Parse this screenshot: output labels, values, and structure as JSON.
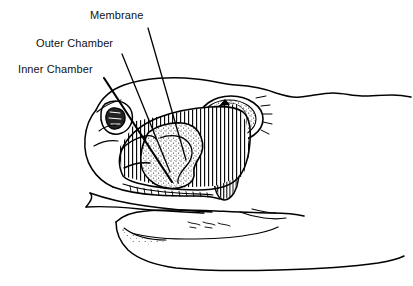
{
  "figure": {
    "style": "black and white pen line drawing",
    "background_color": "#ffffff",
    "ink_color": "#000000"
  },
  "labels": {
    "membrane": "Membrane",
    "outer_chamber": "Outer Chamber",
    "inner_chamber": "Inner Chamber"
  },
  "leader_lines": [
    {
      "name": "membrane-leader",
      "from": [
        148,
        28
      ],
      "to": [
        186,
        160
      ]
    },
    {
      "name": "outer-chamber-leader",
      "from": [
        122,
        54
      ],
      "to": [
        170,
        172
      ]
    },
    {
      "name": "inner-chamber-leader",
      "from": [
        104,
        78
      ],
      "to": [
        172,
        182
      ]
    }
  ],
  "features": [
    {
      "name": "eye",
      "description": "oval eye with vertical slit pupil, stippled iris"
    },
    {
      "name": "nostril",
      "description": "small nostril opening anterior to the pit"
    },
    {
      "name": "pit-organ",
      "description": "loreal pit between eye and nostril, hatched outer chamber and stippled inner chamber"
    },
    {
      "name": "upper-jaw",
      "description": "upper jaw line with scale row"
    },
    {
      "name": "lower-jaw",
      "description": "lower jaw and chin with stippled shading"
    },
    {
      "name": "head-outline",
      "description": "dorsal head profile extending to the right off frame"
    }
  ]
}
